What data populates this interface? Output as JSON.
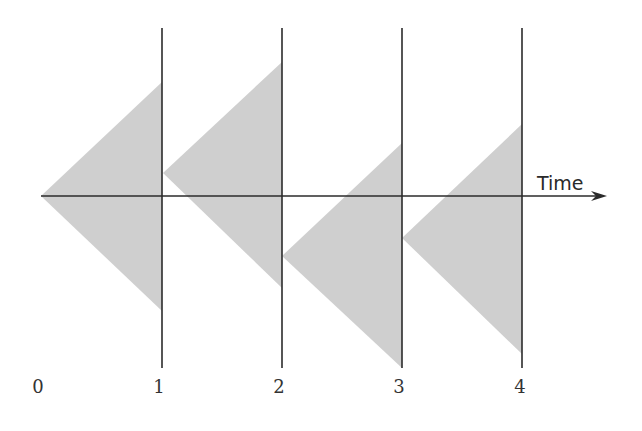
{
  "diagram": {
    "axis": {
      "label": "Time",
      "y": 196,
      "x_start": 41,
      "x_end": 607,
      "color": "#2b2b2b"
    },
    "tick_labels": [
      "0",
      "1",
      "2",
      "3",
      "4"
    ],
    "tick_positions_px": [
      38,
      159,
      279,
      399,
      520
    ],
    "vertical_lines": {
      "x_px": [
        162,
        282,
        402,
        522
      ],
      "y_top": 28,
      "y_bottom": 368,
      "color": "#2b2b2b"
    },
    "triangles": [
      {
        "left": [
          41,
          196
        ],
        "top": [
          162,
          82
        ],
        "bottom": [
          162,
          311
        ]
      },
      {
        "left": [
          163,
          173
        ],
        "top": [
          282,
          62
        ],
        "bottom": [
          282,
          288
        ]
      },
      {
        "left": [
          282,
          256
        ],
        "top": [
          402,
          143
        ],
        "bottom": [
          402,
          368
        ]
      },
      {
        "left": [
          402,
          238
        ],
        "top": [
          522,
          124
        ],
        "bottom": [
          522,
          354
        ]
      }
    ],
    "fill_color": "#cfcfcf"
  }
}
